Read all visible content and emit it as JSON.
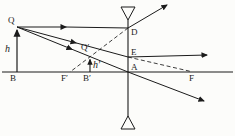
{
  "diagram": {
    "kind": "concave-lens-ray-diagram",
    "colors": {
      "ink": "#1b1b1b",
      "background": "#fcfcfa"
    },
    "labels": {
      "object_top": "Q",
      "object_height": "h",
      "object_base": "B",
      "lens_upper_point": "D",
      "lens_mid_point": "E",
      "optical_center": "A",
      "left_focus": "F′",
      "right_focus": "F",
      "image_top": "Q′",
      "image_height": "h′",
      "image_base": "B′"
    }
  }
}
